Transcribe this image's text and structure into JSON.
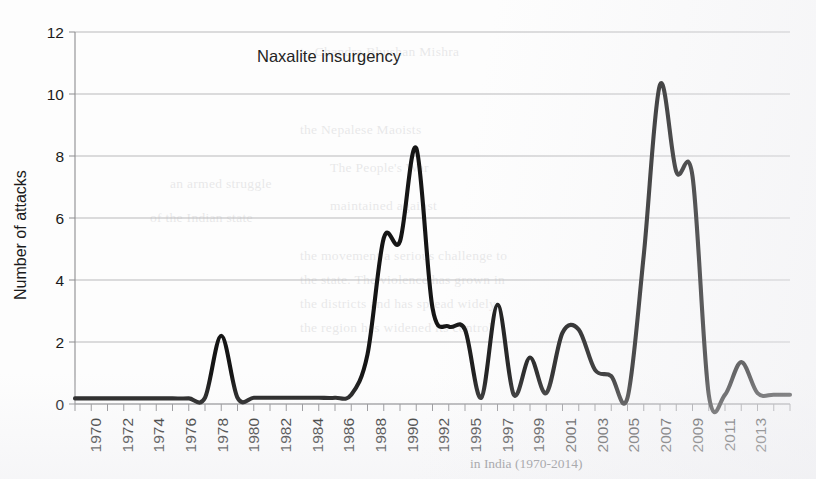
{
  "figure": {
    "annotation": "Naxalite insurgency",
    "caption_faint": "in India (1970-2014)"
  },
  "bleed_through_text": [
    {
      "text": "to Chandra Bhushan Mishra",
      "x": 300,
      "y": 44
    },
    {
      "text": "the Nepalese Maoists",
      "x": 300,
      "y": 122
    },
    {
      "text": "The People's War",
      "x": 330,
      "y": 160
    },
    {
      "text": "maintained against",
      "x": 330,
      "y": 198
    },
    {
      "text": "the movement a serious challenge to",
      "x": 300,
      "y": 248
    },
    {
      "text": "the state. The violence has grown in",
      "x": 300,
      "y": 272
    },
    {
      "text": "the districts and has spread widely,",
      "x": 300,
      "y": 296
    },
    {
      "text": "the region has widened its control",
      "x": 300,
      "y": 320
    },
    {
      "text": "an armed struggle",
      "x": 170,
      "y": 176
    },
    {
      "text": "of the Indian state",
      "x": 150,
      "y": 210
    }
  ],
  "chart_data": {
    "type": "line",
    "title": "Naxalite insurgency",
    "xlabel": "",
    "ylabel": "Number of attacks",
    "ylim": [
      0,
      12
    ],
    "yticks": [
      0,
      2,
      4,
      6,
      8,
      10,
      12
    ],
    "xlim": [
      1970,
      2014
    ],
    "grid": true,
    "legend": "none",
    "xtick_labels": [
      "1970",
      "1972",
      "1974",
      "1976",
      "1978",
      "1980",
      "1982",
      "1984",
      "1986",
      "1988",
      "1990",
      "1992",
      "1995",
      "1997",
      "1999",
      "2001",
      "2003",
      "2005",
      "2007",
      "2009",
      "2011",
      "2013"
    ],
    "xtick_years": [
      1970,
      1972,
      1974,
      1976,
      1978,
      1980,
      1982,
      1984,
      1986,
      1988,
      1990,
      1992,
      1995,
      1997,
      1999,
      2001,
      2003,
      2005,
      2007,
      2009,
      2011,
      2013
    ],
    "series": [
      {
        "name": "Number of attacks",
        "color": "#151515",
        "x": [
          1970,
          1971,
          1972,
          1973,
          1974,
          1975,
          1976,
          1977,
          1978,
          1979,
          1980,
          1981,
          1982,
          1983,
          1984,
          1985,
          1986,
          1987,
          1988,
          1989,
          1990,
          1991,
          1992,
          1993,
          1994,
          1995,
          1996,
          1997,
          1998,
          1999,
          2000,
          2001,
          2002,
          2003,
          2004,
          2005,
          2006,
          2007,
          2008,
          2009,
          2010,
          2011,
          2012,
          2013,
          2014
        ],
        "values": [
          0.18,
          0.18,
          0.18,
          0.18,
          0.18,
          0.18,
          0.18,
          0.18,
          0.2,
          2.2,
          0.2,
          0.2,
          0.2,
          0.2,
          0.2,
          0.2,
          0.2,
          0.3,
          1.6,
          5.35,
          5.25,
          8.25,
          3.1,
          2.5,
          2.4,
          0.2,
          3.2,
          0.3,
          1.5,
          0.35,
          2.3,
          2.4,
          1.1,
          0.9,
          0.2,
          4.8,
          10.3,
          7.5,
          7.35,
          0.3,
          0.3,
          1.35,
          0.35,
          0.3,
          0.3
        ]
      }
    ]
  }
}
